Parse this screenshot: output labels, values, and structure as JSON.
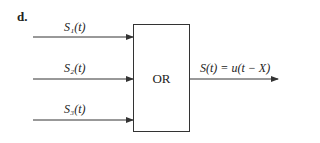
{
  "figure": {
    "label": "d.",
    "gate": {
      "type": "OR",
      "label": "OR"
    },
    "inputs": [
      {
        "label": "S₁(t)"
      },
      {
        "label": "S₂(t)"
      },
      {
        "label": "S₃(t)"
      }
    ],
    "output": {
      "label": "S(t) = u(t − X)"
    }
  }
}
